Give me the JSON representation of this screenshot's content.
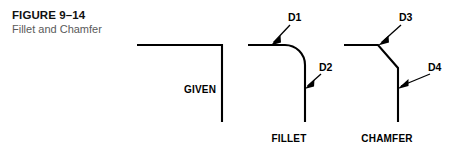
{
  "figure": {
    "number_label": "FIGURE 9–14",
    "title": "Fillet and Chamfer",
    "background_color": "#ffffff",
    "line_color": "#000000",
    "subtitle_color": "#5a5a5a"
  },
  "diagrams": [
    {
      "id": "given",
      "caption": "GIVEN",
      "description": "sharp square corner, no treatment",
      "labels": []
    },
    {
      "id": "fillet",
      "caption": "FILLET",
      "description": "corner rounded by a tangent arc",
      "labels": [
        {
          "text": "D1",
          "points_to": "upper tangent point of fillet arc on horizontal edge"
        },
        {
          "text": "D2",
          "points_to": "lower tangent point of fillet arc on vertical edge"
        }
      ]
    },
    {
      "id": "chamfer",
      "caption": "CHAMFER",
      "description": "corner cut by an angled bevel face",
      "labels": [
        {
          "text": "D3",
          "points_to": "upper end of chamfer bevel on horizontal edge"
        },
        {
          "text": "D4",
          "points_to": "lower end of chamfer bevel on vertical edge"
        }
      ]
    }
  ]
}
